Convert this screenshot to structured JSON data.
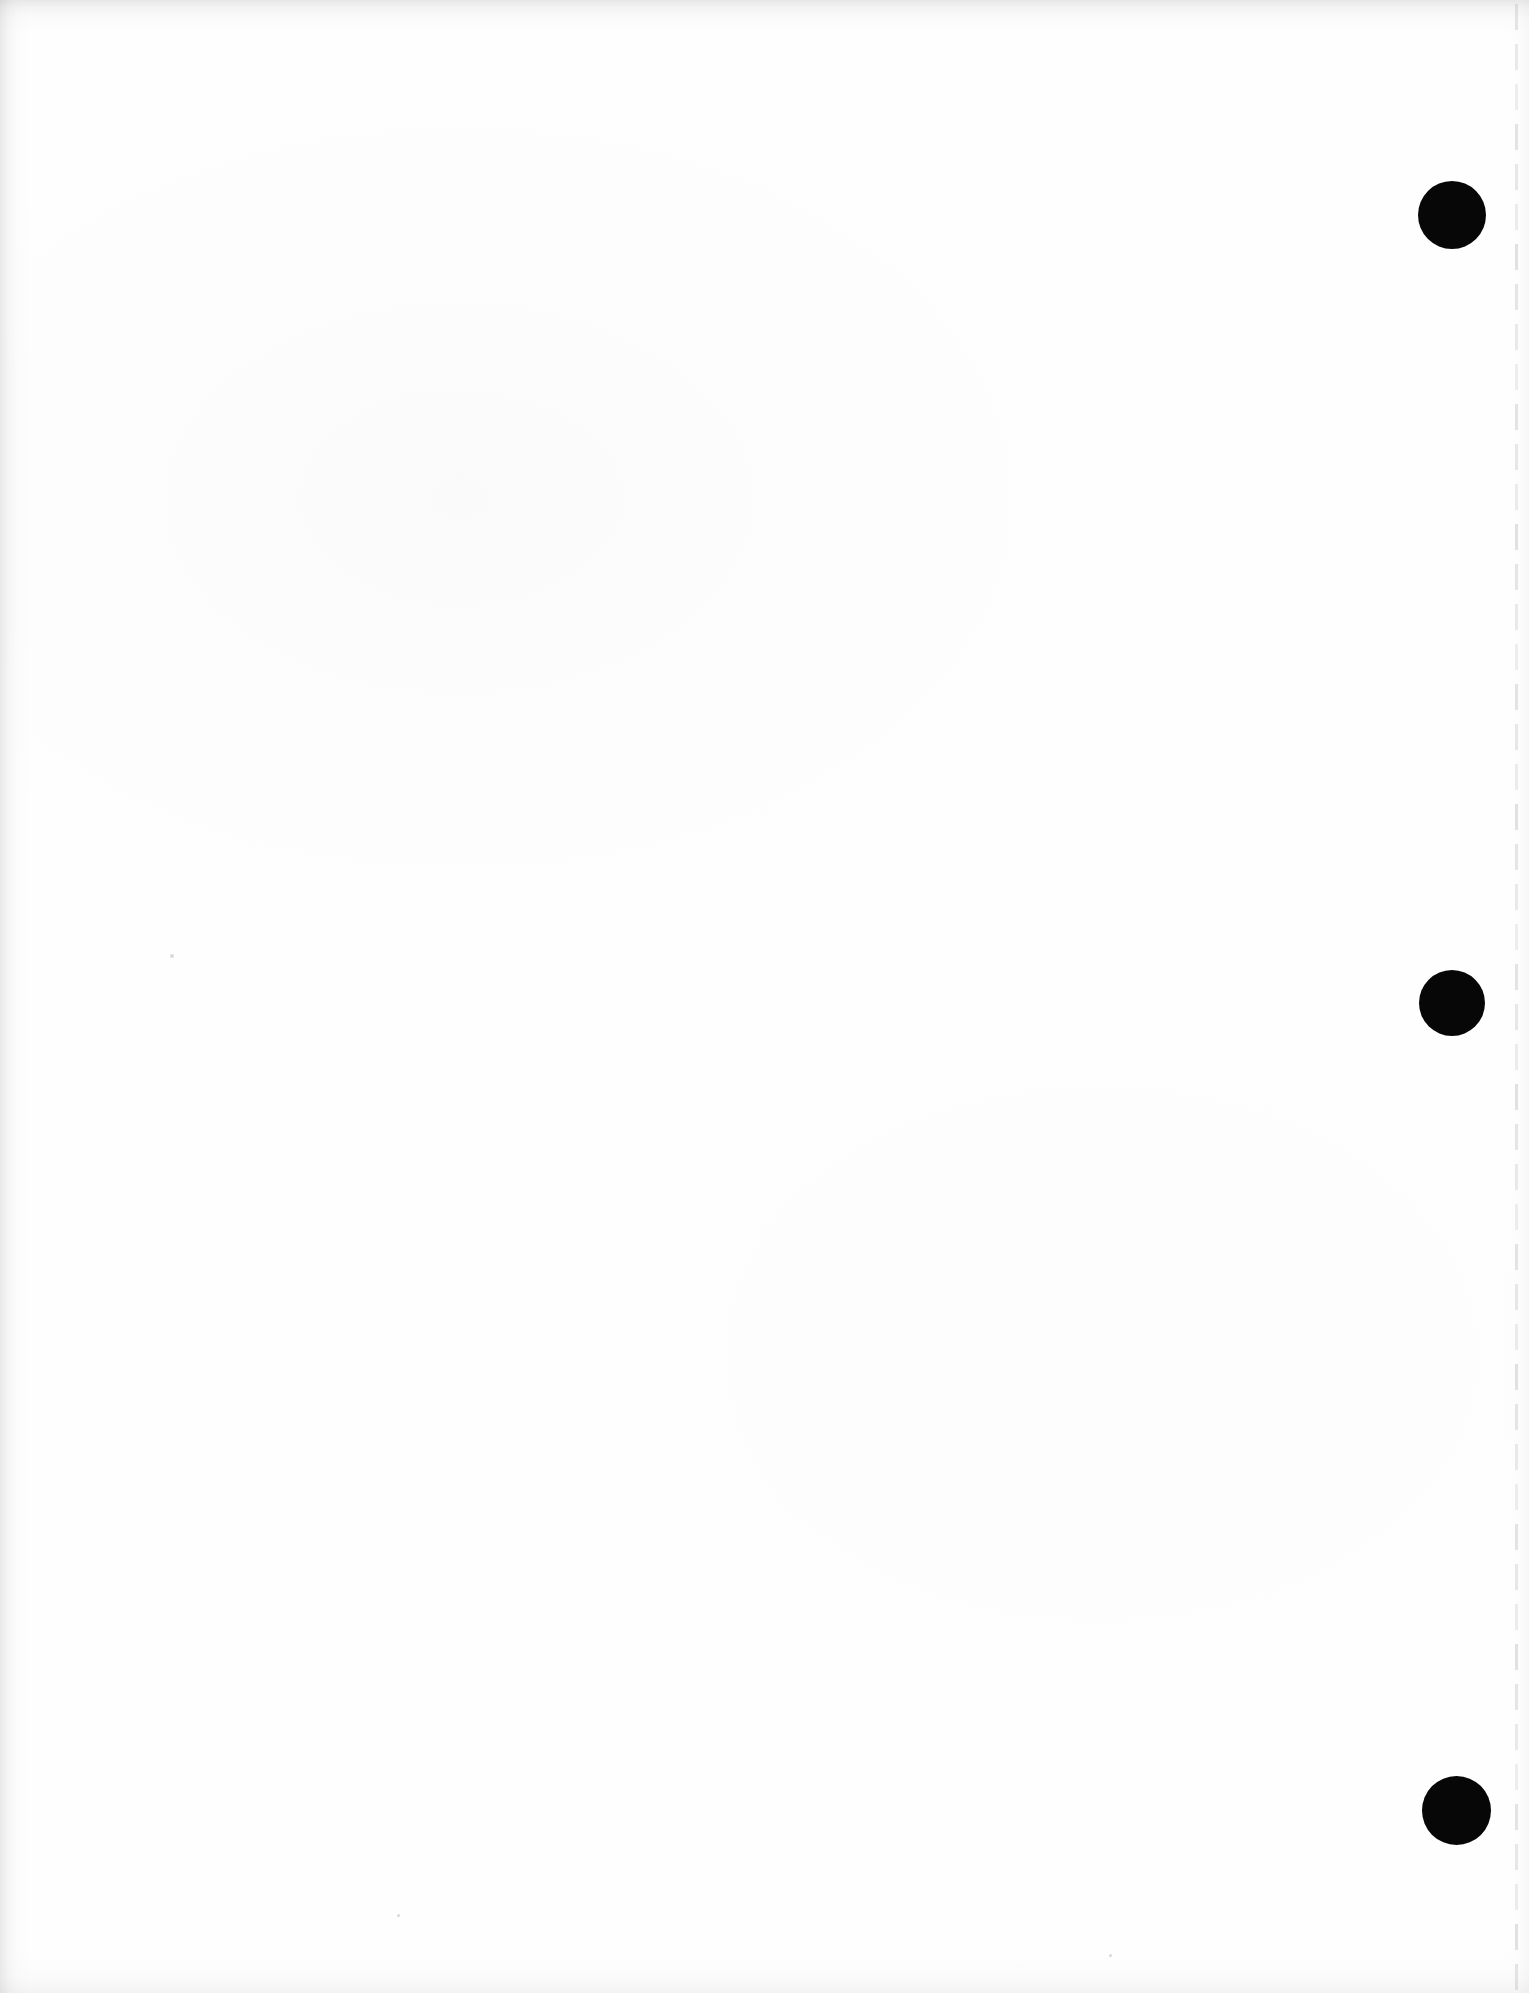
{
  "document": {
    "kind": "scanned-page",
    "page_state": "blank",
    "visible_text": "",
    "width_px": 1529,
    "height_px": 1993,
    "background_color": "#fefefe"
  },
  "marks": {
    "hole_punches": {
      "label": "hole-punch mark",
      "color": "#070707",
      "count": 3,
      "items": [
        {
          "name": "hole-punch-top",
          "cx": 1452,
          "cy": 215,
          "diameter": 68
        },
        {
          "name": "hole-punch-middle",
          "cx": 1452,
          "cy": 1003,
          "diameter": 66
        },
        {
          "name": "hole-punch-bottom",
          "cx": 1456,
          "cy": 1810,
          "diameter": 69
        }
      ]
    },
    "margin_rule": {
      "name": "dashed-margin-rule",
      "orientation": "vertical",
      "x": 1515,
      "color": "#8c8c8c",
      "dash_length": 26,
      "gap_length": 14,
      "thickness": 3
    },
    "specks": [
      {
        "cx": 172,
        "cy": 956,
        "d": 4
      },
      {
        "cx": 1110,
        "cy": 1955,
        "d": 3
      },
      {
        "cx": 398,
        "cy": 1915,
        "d": 3
      }
    ]
  },
  "scan_artifacts": {
    "top_shadow_color": "#969696",
    "left_shadow_color": "#969696",
    "bottom_shadow_color": "#b0b0b0",
    "right_shadow_color": "#c6c6c6"
  }
}
